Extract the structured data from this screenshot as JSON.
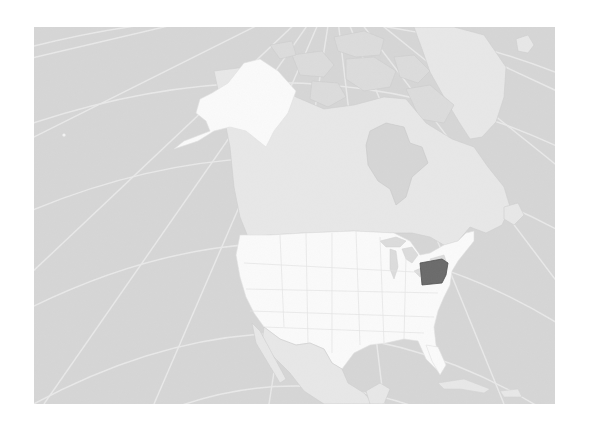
{
  "map": {
    "title": "Locator map of Pennsylvania in North America",
    "projection": "orthographic",
    "region": "North America",
    "highlighted_feature": {
      "name": "Pennsylvania",
      "type": "state",
      "country": "United States"
    },
    "colors": {
      "page_background": "#ffffff",
      "ocean": "#d6d6d6",
      "graticule": "#ececec",
      "other_land": "#e8e8e8",
      "arctic_islands": "#dcdcdc",
      "us_land": "#fbfbfb",
      "alaska": "#fbfbfb",
      "state_borders": "#e4e4e4",
      "highlight": "#6a6a6a",
      "highlight_border": "#4f4f4f"
    },
    "features": [
      "Alaska",
      "Canada",
      "Greenland",
      "Hudson Bay",
      "Contiguous United States",
      "Great Lakes",
      "Mexico",
      "Gulf of Mexico",
      "Cuba",
      "Iceland"
    ]
  }
}
